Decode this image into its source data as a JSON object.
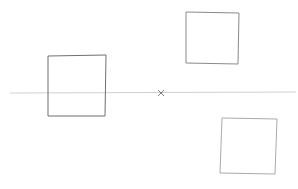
{
  "canvas": {
    "width": 298,
    "height": 189,
    "background": "#ffffff",
    "stroke": "#8a8a8a"
  },
  "sketch": {
    "description": "Pencil sketch: horizon line with vanishing point and three squares",
    "horizon_line": {
      "x1": 10,
      "y1": 93,
      "x2": 296,
      "y2": 92
    },
    "vanishing_point": {
      "x": 161,
      "y": 93,
      "glyph": "×"
    },
    "squares": [
      {
        "name": "left-square",
        "x": 48,
        "y": 56,
        "w": 58,
        "h": 60
      },
      {
        "name": "top-right-square",
        "x": 186,
        "y": 12,
        "w": 53,
        "h": 52
      },
      {
        "name": "bottom-right-square",
        "x": 220,
        "y": 118,
        "w": 57,
        "h": 56
      }
    ]
  }
}
